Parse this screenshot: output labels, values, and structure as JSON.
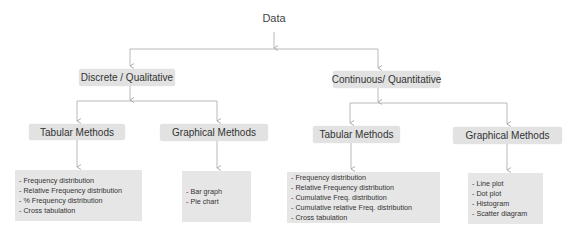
{
  "root": {
    "label": "Data"
  },
  "branches": [
    {
      "label": "Discrete / Qualitative",
      "children": [
        {
          "label": "Tabular Methods",
          "items": [
            "- Frequency distribution",
            "- Relative Frequency distribution",
            "- % Frequency distribution",
            "- Cross tabulation"
          ]
        },
        {
          "label": "Graphical Methods",
          "items": [
            "- Bar graph",
            "- Pie chart"
          ]
        }
      ]
    },
    {
      "label": "Continuous/ Quantitative",
      "children": [
        {
          "label": "Tabular Methods",
          "items": [
            "- Frequency distribution",
            "- Relative Frequency distribution",
            "- Cumulative Freq. distribution",
            "- Cumulative relative Freq. distribution",
            "- Cross tabulation"
          ]
        },
        {
          "label": "Graphical Methods",
          "items": [
            "- Line plot",
            "- Dot plot",
            "- Histogram",
            "- Scatter diagram"
          ]
        }
      ]
    }
  ],
  "colors": {
    "box_fill": "#e2e2e2",
    "connector": "#aaaaaa",
    "text": "#333333"
  }
}
